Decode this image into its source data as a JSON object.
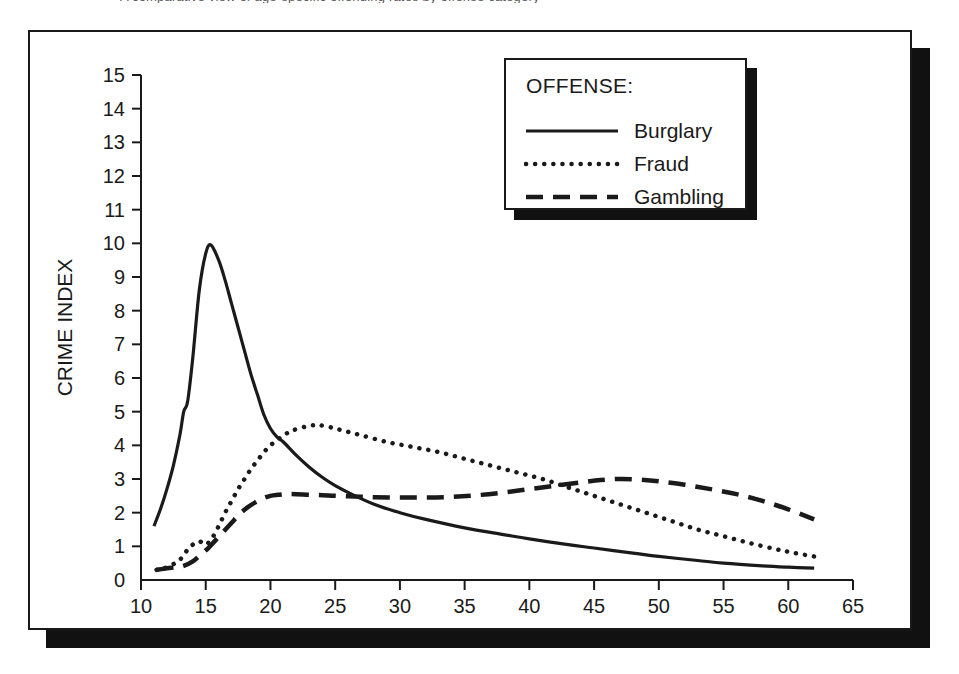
{
  "figure": {
    "caption_sliver": "A comparative view of age-specific offending rates by offense category",
    "legend": {
      "title": "OFFENSE:",
      "entries": [
        {
          "label": "Burglary",
          "style": "solid"
        },
        {
          "label": "Fraud",
          "style": "dotted"
        },
        {
          "label": "Gambling",
          "style": "dashed"
        }
      ]
    }
  },
  "chart_data": {
    "type": "line",
    "title": "",
    "xlabel": "AGE",
    "ylabel": "CRIME INDEX",
    "xlim": [
      10,
      65
    ],
    "ylim": [
      0,
      15
    ],
    "xticks": [
      10,
      15,
      20,
      25,
      30,
      35,
      40,
      45,
      50,
      55,
      60,
      65
    ],
    "yticks": [
      0,
      1,
      2,
      3,
      4,
      5,
      6,
      7,
      8,
      9,
      10,
      11,
      12,
      13,
      14,
      15
    ],
    "grid": false,
    "legend_position": "top-right",
    "series": [
      {
        "name": "Burglary",
        "style": "solid",
        "x": [
          11.0,
          11.5,
          12.0,
          12.5,
          13.0,
          13.3,
          13.6,
          14.0,
          14.5,
          15.0,
          15.4,
          16.0,
          16.5,
          17.0,
          17.5,
          18.0,
          18.5,
          19.0,
          19.5,
          20.0,
          20.5,
          21.0,
          22.0,
          23.0,
          24.0,
          25.0,
          26.0,
          28.0,
          30.0,
          32.0,
          35.0,
          38.0,
          40.0,
          43.0,
          45.0,
          48.0,
          50.0,
          53.0,
          55.0,
          58.0,
          60.0,
          62.0
        ],
        "y": [
          1.6,
          2.1,
          2.7,
          3.4,
          4.3,
          5.0,
          5.3,
          6.6,
          8.6,
          9.7,
          9.95,
          9.5,
          8.9,
          8.2,
          7.5,
          6.8,
          6.1,
          5.5,
          4.9,
          4.5,
          4.25,
          4.1,
          3.7,
          3.35,
          3.05,
          2.8,
          2.6,
          2.25,
          2.0,
          1.8,
          1.55,
          1.35,
          1.22,
          1.05,
          0.95,
          0.8,
          0.7,
          0.58,
          0.5,
          0.42,
          0.38,
          0.35
        ]
      },
      {
        "name": "Fraud",
        "style": "dotted",
        "x": [
          11.2,
          11.8,
          12.4,
          13.0,
          13.5,
          14.0,
          14.5,
          15.0,
          15.5,
          16.0,
          16.5,
          17.0,
          17.5,
          18.0,
          18.5,
          19.0,
          19.5,
          20.0,
          20.5,
          21.0,
          21.5,
          22.0,
          23.0,
          23.7,
          24.5,
          25.5,
          27.0,
          29.0,
          31.0,
          33.0,
          35.0,
          37.0,
          39.0,
          41.0,
          43.0,
          45.0,
          47.0,
          49.0,
          51.0,
          53.0,
          55.0,
          57.0,
          59.0,
          60.5,
          62.0
        ],
        "y": [
          0.3,
          0.35,
          0.45,
          0.6,
          0.85,
          1.05,
          1.15,
          1.05,
          1.25,
          1.6,
          2.0,
          2.35,
          2.7,
          3.0,
          3.3,
          3.55,
          3.8,
          4.0,
          4.15,
          4.3,
          4.4,
          4.48,
          4.58,
          4.6,
          4.55,
          4.45,
          4.3,
          4.1,
          3.95,
          3.8,
          3.6,
          3.4,
          3.2,
          3.0,
          2.75,
          2.5,
          2.25,
          2.0,
          1.75,
          1.5,
          1.3,
          1.1,
          0.92,
          0.8,
          0.7
        ]
      },
      {
        "name": "Gambling",
        "style": "dashed",
        "x": [
          11.2,
          12.0,
          12.7,
          13.3,
          14.0,
          14.6,
          15.2,
          15.8,
          16.4,
          17.0,
          17.6,
          18.2,
          18.8,
          19.4,
          20.0,
          20.6,
          21.2,
          22.0,
          23.0,
          24.0,
          25.0,
          26.5,
          28.0,
          30.0,
          32.0,
          34.0,
          36.0,
          38.0,
          40.0,
          42.0,
          44.0,
          45.5,
          47.0,
          48.5,
          50.0,
          52.0,
          54.0,
          56.0,
          58.0,
          60.0,
          62.0
        ],
        "y": [
          0.3,
          0.35,
          0.38,
          0.42,
          0.55,
          0.75,
          0.95,
          1.2,
          1.45,
          1.7,
          1.95,
          2.15,
          2.3,
          2.42,
          2.5,
          2.53,
          2.55,
          2.55,
          2.53,
          2.52,
          2.5,
          2.48,
          2.46,
          2.45,
          2.45,
          2.47,
          2.52,
          2.6,
          2.7,
          2.8,
          2.9,
          2.97,
          3.0,
          2.98,
          2.93,
          2.83,
          2.7,
          2.55,
          2.35,
          2.1,
          1.8
        ]
      }
    ]
  }
}
